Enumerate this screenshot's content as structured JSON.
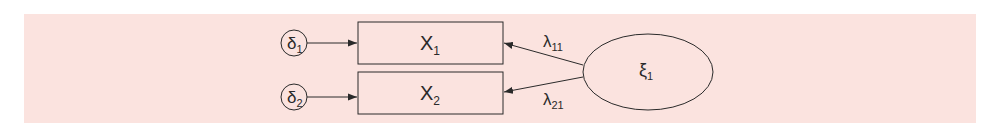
{
  "diagram": {
    "type": "measurement-model",
    "background_color": "#fbe3df",
    "stroke_color": "#2a2a2a",
    "errors": [
      {
        "symbol": "δ",
        "sub": "1"
      },
      {
        "symbol": "δ",
        "sub": "2"
      }
    ],
    "indicators": [
      {
        "symbol": "X",
        "sub": "1"
      },
      {
        "symbol": "X",
        "sub": "2"
      }
    ],
    "loadings": [
      {
        "symbol": "λ",
        "sub": "11"
      },
      {
        "symbol": "λ",
        "sub": "21"
      }
    ],
    "latent": {
      "symbol": "ξ",
      "sub": "1"
    }
  }
}
